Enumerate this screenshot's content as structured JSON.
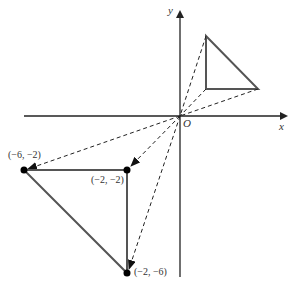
{
  "diagram": {
    "axes": {
      "x_label": "x",
      "y_label": "y",
      "origin_label": "O"
    },
    "original_triangle": {
      "vertices": [
        [
          1,
          3
        ],
        [
          1,
          1
        ],
        [
          3,
          1
        ]
      ]
    },
    "image_triangle": {
      "vertices": [
        [
          -6,
          -2
        ],
        [
          -2,
          -2
        ],
        [
          -2,
          -6
        ]
      ],
      "labels": [
        "(−6, −2)",
        "(−2, −2)",
        "(−2, −6)"
      ]
    },
    "colors": {
      "triangle": "#555555",
      "axis": "#222222",
      "dashed": "#222222",
      "point": "#000000"
    }
  }
}
